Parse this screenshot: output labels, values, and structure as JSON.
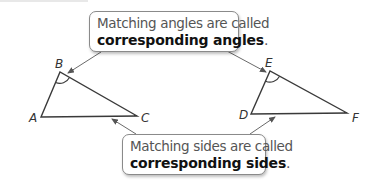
{
  "callouts": {
    "angles": {
      "line1": "Matching angles are called",
      "term": "corresponding angles",
      "punct": "."
    },
    "sides": {
      "line1": "Matching sides are called",
      "term": "corresponding sides",
      "punct": "."
    }
  },
  "triangles": [
    {
      "name": "ABC",
      "vertices": [
        {
          "label": "A",
          "x": 41,
          "y": 117
        },
        {
          "label": "B",
          "x": 60,
          "y": 72
        },
        {
          "label": "C",
          "x": 137,
          "y": 116
        }
      ],
      "marked_angle": "B"
    },
    {
      "name": "DEF",
      "vertices": [
        {
          "label": "D",
          "x": 251,
          "y": 114
        },
        {
          "label": "E",
          "x": 270,
          "y": 71
        },
        {
          "label": "F",
          "x": 347,
          "y": 113
        }
      ],
      "marked_angle": "E"
    }
  ],
  "labels": {
    "A": "A",
    "B": "B",
    "C": "C",
    "D": "D",
    "E": "E",
    "F": "F"
  },
  "colors": {
    "line": "#3a3a3a",
    "arrow": "#6a6a6a",
    "callout_border": "#8a8a8a",
    "text_regular": "#555555",
    "text_bold": "#111111"
  }
}
